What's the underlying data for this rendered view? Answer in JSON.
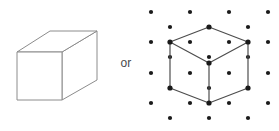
{
  "figure": {
    "caption_connector": "or",
    "background_color": "#ffffff"
  },
  "solid_cube": {
    "name": "oblique-projection-cube",
    "stroke_color": "#8c8c8c",
    "fill_color": "#ffffff",
    "stroke_width": 1,
    "front_face": [
      [
        17,
        52
      ],
      [
        62,
        52
      ],
      [
        62,
        100
      ],
      [
        17,
        100
      ]
    ],
    "top_face": [
      [
        17,
        52
      ],
      [
        50,
        31
      ],
      [
        97,
        31
      ],
      [
        62,
        52
      ]
    ],
    "right_face": [
      [
        62,
        52
      ],
      [
        97,
        31
      ],
      [
        97,
        80
      ],
      [
        62,
        100
      ]
    ]
  },
  "lattice_cube": {
    "name": "isometric-cube-on-dot-lattice",
    "dot_color": "#1a1a1a",
    "dot_radius": 2.1,
    "edge_color": "#4d4d4d",
    "edge_width": 1.2,
    "vertex_dot_radius": 2.6,
    "columns_x": [
      12,
      31,
      51,
      70,
      90,
      109,
      129
    ],
    "rows_even_y": [
      12,
      42,
      73,
      103
    ],
    "rows_odd_y": [
      27,
      57,
      88,
      118
    ],
    "cube_vertices": {
      "top": [
        70,
        27
      ],
      "upper_left": [
        31,
        42
      ],
      "upper_right": [
        109,
        42
      ],
      "center": [
        70,
        63
      ],
      "lower_left": [
        31,
        88
      ],
      "lower_right": [
        109,
        88
      ],
      "bottom": [
        70,
        103
      ]
    },
    "cube_edges": [
      [
        [
          70,
          27
        ],
        [
          31,
          42
        ]
      ],
      [
        [
          70,
          27
        ],
        [
          109,
          42
        ]
      ],
      [
        [
          31,
          42
        ],
        [
          70,
          63
        ]
      ],
      [
        [
          109,
          42
        ],
        [
          70,
          63
        ]
      ],
      [
        [
          31,
          42
        ],
        [
          31,
          88
        ]
      ],
      [
        [
          109,
          42
        ],
        [
          109,
          88
        ]
      ],
      [
        [
          70,
          63
        ],
        [
          70,
          103
        ]
      ],
      [
        [
          31,
          88
        ],
        [
          70,
          103
        ]
      ],
      [
        [
          109,
          88
        ],
        [
          70,
          103
        ]
      ]
    ]
  }
}
